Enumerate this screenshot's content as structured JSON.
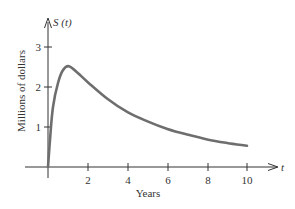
{
  "chart_data": {
    "type": "line",
    "title": "",
    "function_label": "S (t)",
    "xlabel": "Years",
    "ylabel": "Millions of dollars",
    "x_axis_symbol": "t",
    "xlim": [
      0,
      11.5
    ],
    "ylim": [
      0,
      3.5
    ],
    "x_ticks": [
      2,
      4,
      6,
      8,
      10
    ],
    "y_ticks": [
      1,
      2,
      3
    ],
    "grid": false,
    "legend": null,
    "series": [
      {
        "name": "S(t)",
        "color": "#6e6e6e",
        "x": [
          0,
          0.1,
          0.25,
          0.5,
          0.75,
          1.05,
          1.5,
          2,
          3,
          4,
          5,
          6,
          7,
          8,
          9,
          10
        ],
        "values": [
          0,
          0.68,
          1.5,
          2.1,
          2.42,
          2.52,
          2.35,
          2.12,
          1.7,
          1.37,
          1.14,
          0.95,
          0.81,
          0.69,
          0.6,
          0.53
        ]
      }
    ]
  },
  "labels": {
    "function": "S (t)",
    "x_symbol": "t",
    "xlabel": "Years",
    "ylabel": "Millions of dollars",
    "x_tick_labels": [
      "2",
      "4",
      "6",
      "8",
      "10"
    ],
    "y_tick_labels": [
      "1",
      "2",
      "3"
    ]
  }
}
